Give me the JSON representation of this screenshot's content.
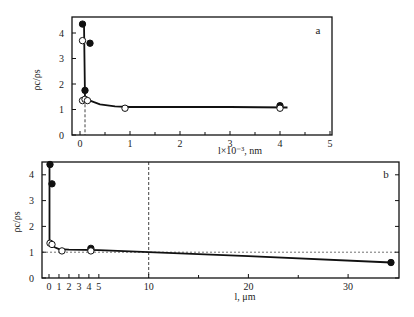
{
  "figure": {
    "background": "#ffffff",
    "line_color": "#111111"
  },
  "chart_data": [
    {
      "id": "a",
      "type": "scatter",
      "panel_label": "a",
      "title": "",
      "xlabel": "l×10⁻³, nm",
      "ylabel": "ρc/ρs",
      "xlim": [
        -0.1,
        5
      ],
      "ylim": [
        0,
        4.6
      ],
      "x_ticks": [
        0,
        1,
        2,
        3,
        4,
        5
      ],
      "x_minor_ticks": [
        0.5,
        1.5,
        2.5,
        3.5,
        4.5
      ],
      "y_ticks": [
        0,
        1,
        2,
        3,
        4
      ],
      "grid": false,
      "vertical_dashed_line_x": 0.1,
      "series": [
        {
          "name": "filled",
          "marker": "filled-circle",
          "points": [
            [
              0.05,
              4.35
            ],
            [
              0.2,
              3.6
            ],
            [
              0.1,
              1.75
            ],
            [
              4.0,
              1.15
            ]
          ]
        },
        {
          "name": "open",
          "marker": "open-circle",
          "points": [
            [
              0.05,
              3.7
            ],
            [
              0.05,
              1.35
            ],
            [
              0.1,
              1.4
            ],
            [
              0.15,
              1.35
            ],
            [
              0.9,
              1.05
            ],
            [
              4.0,
              1.05
            ]
          ]
        }
      ],
      "fit_curve": [
        [
          0.08,
          4.4
        ],
        [
          0.1,
          1.45
        ],
        [
          0.2,
          1.35
        ],
        [
          0.4,
          1.2
        ],
        [
          0.7,
          1.12
        ],
        [
          1.0,
          1.1
        ],
        [
          2.0,
          1.1
        ],
        [
          3.0,
          1.1
        ],
        [
          4.15,
          1.08
        ]
      ]
    },
    {
      "id": "b",
      "type": "scatter",
      "panel_label": "b",
      "title": "",
      "xlabel": "l,  μm",
      "ylabel": "ρc/ρs",
      "xlim": [
        -0.7,
        35.3
      ],
      "ylim": [
        0,
        4.5
      ],
      "x_ticks": [
        0,
        1,
        2,
        3,
        4,
        5,
        10,
        20,
        30
      ],
      "x_minor_ticks": [
        15,
        25
      ],
      "y_ticks": [
        0,
        1,
        2,
        3,
        4
      ],
      "grid": false,
      "vertical_dashed_line_x": 10,
      "horizontal_dashed_line_y": 1,
      "series": [
        {
          "name": "filled",
          "marker": "filled-circle",
          "points": [
            [
              0.1,
              4.4
            ],
            [
              0.3,
              3.65
            ],
            [
              4.2,
              1.15
            ],
            [
              34.3,
              0.6
            ]
          ]
        },
        {
          "name": "open",
          "marker": "open-circle",
          "points": [
            [
              0.1,
              1.35
            ],
            [
              0.3,
              1.3
            ],
            [
              1.3,
              1.05
            ],
            [
              4.2,
              1.05
            ]
          ]
        }
      ],
      "fit_curve": [
        [
          0.05,
          4.4
        ],
        [
          0.05,
          1.35
        ],
        [
          0.5,
          1.2
        ],
        [
          1.0,
          1.12
        ],
        [
          2.0,
          1.1
        ],
        [
          5.0,
          1.08
        ],
        [
          10,
          1.0
        ],
        [
          20,
          0.85
        ],
        [
          34.3,
          0.6
        ]
      ]
    }
  ],
  "panels": {
    "a": {
      "frame": {
        "left": 72,
        "top": 17,
        "right": 332,
        "bottom": 135
      },
      "x_origin_px": 80,
      "x_px_per_unit": 50,
      "y_origin_px": 135,
      "y_px_per_unit": 25.5,
      "ylabel_pos": [
        40,
        80
      ],
      "xlabel_pos": [
        240,
        154
      ],
      "letter_pos": [
        318,
        34
      ],
      "tick_labels_x": [
        "0",
        "1",
        "2",
        "3",
        "4",
        "5"
      ],
      "tick_labels_y": [
        "0",
        "1",
        "2",
        "3",
        "4"
      ]
    },
    "b": {
      "frame": {
        "left": 42,
        "top": 162,
        "right": 399,
        "bottom": 278
      },
      "x_origin_px": 49,
      "x_px_per_unit": 9.97,
      "y_origin_px": 278,
      "y_px_per_unit": 25.8,
      "ylabel_pos": [
        20,
        222
      ],
      "xlabel_pos": [
        245,
        300
      ],
      "letter_pos": [
        386,
        178
      ],
      "tick_labels_x": [
        "0",
        "1",
        "2",
        "3",
        "4",
        "5",
        "10",
        "20",
        "30"
      ],
      "tick_labels_y": [
        "0",
        "1",
        "2",
        "3",
        "4"
      ]
    }
  }
}
